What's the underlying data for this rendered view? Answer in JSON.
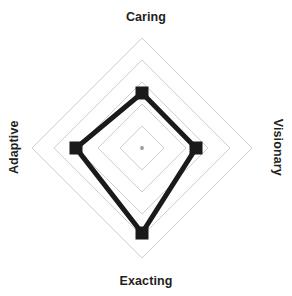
{
  "chart_data": {
    "type": "radar",
    "title": "",
    "subtitle": "",
    "xlabel": "",
    "ylabel": "",
    "categories": [
      "Caring",
      "Visionary",
      "Exacting",
      "Adaptive"
    ],
    "values": [
      2.5,
      2.45,
      3.85,
      3.0
    ],
    "series": [
      {
        "name": "Profile",
        "values": [
          2.5,
          2.45,
          3.85,
          3.0
        ]
      }
    ],
    "rlim": [
      0,
      5
    ],
    "rings": 5,
    "grid": true,
    "grid_shape": "polygon",
    "legend": "none",
    "axis_label_rotation": {
      "Caring": 0,
      "Visionary": 90,
      "Exacting": 0,
      "Adaptive": -90
    },
    "colors": {
      "line": "#1a1a1a",
      "marker": "#1a1a1a",
      "grid": "#c8c8c8",
      "center_dot": "#9a9a9a",
      "background": "#ffffff",
      "label_text": "#231f20"
    },
    "marker": "square",
    "line_width_px": 5,
    "annotations": []
  },
  "labels": {
    "top": "Caring",
    "right": "Visionary",
    "bottom": "Exacting",
    "left": "Adaptive"
  },
  "geometry": {
    "center_x": 142,
    "center_y": 148,
    "max_radius": 110,
    "ring_radii": [
      22,
      44,
      66,
      88,
      110
    ],
    "vertex_radii": {
      "top": 55,
      "right": 54,
      "bottom": 85,
      "left": 66
    }
  }
}
